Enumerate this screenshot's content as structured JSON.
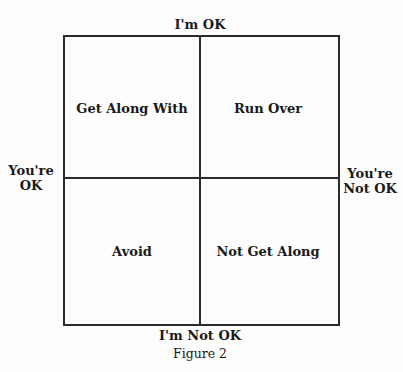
{
  "diagram": {
    "axes": {
      "top": "I'm OK",
      "bottom": "I'm Not OK",
      "left_line1": "You're",
      "left_line2": "OK",
      "right_line1": "You're",
      "right_line2": "Not OK"
    },
    "quadrants": {
      "top_left": "Get Along With",
      "top_right": "Run Over",
      "bottom_left": "Avoid",
      "bottom_right": "Not Get Along"
    },
    "caption": "Figure 2",
    "line_color": "#2a2a2a"
  }
}
